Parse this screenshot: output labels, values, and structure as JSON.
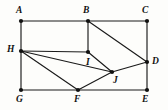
{
  "figure": {
    "background_color": "#fdfdfb",
    "line_color": "#1a1a1a",
    "vertex_color": "#111111",
    "width": 168,
    "height": 110,
    "vertices": [
      {
        "id": "A",
        "label": "A",
        "x": 21,
        "y": 21,
        "label_x": 16,
        "label_y": 6,
        "role": "top-left-corner"
      },
      {
        "id": "B",
        "label": "B",
        "x": 88,
        "y": 21,
        "label_x": 83,
        "label_y": 6,
        "role": "top-middle-corner"
      },
      {
        "id": "C",
        "label": "C",
        "x": 147,
        "y": 21,
        "label_x": 142,
        "label_y": 6,
        "role": "top-right-corner"
      },
      {
        "id": "D",
        "label": "D",
        "x": 147,
        "y": 62,
        "label_x": 152,
        "label_y": 57,
        "role": "right-interior-point"
      },
      {
        "id": "E",
        "label": "E",
        "x": 147,
        "y": 90,
        "label_x": 142,
        "label_y": 95,
        "role": "bottom-right-corner"
      },
      {
        "id": "F",
        "label": "F",
        "x": 78,
        "y": 90,
        "label_x": 74,
        "label_y": 95,
        "role": "bottom-middle-point"
      },
      {
        "id": "G",
        "label": "G",
        "x": 21,
        "y": 90,
        "label_x": 16,
        "label_y": 95,
        "role": "bottom-left-corner"
      },
      {
        "id": "H",
        "label": "H",
        "x": 21,
        "y": 51,
        "label_x": 7,
        "label_y": 45,
        "role": "left-interior-point"
      },
      {
        "id": "I",
        "label": "I",
        "x": 88,
        "y": 52,
        "label_x": 86,
        "label_y": 58,
        "role": "center-point"
      },
      {
        "id": "J",
        "label": "J",
        "x": 112,
        "y": 72,
        "label_x": 113,
        "label_y": 76,
        "role": "center-lower-point"
      }
    ],
    "edges": [
      {
        "id": "AB",
        "from": "A",
        "to": "B"
      },
      {
        "id": "BC",
        "from": "B",
        "to": "C"
      },
      {
        "id": "AH",
        "from": "A",
        "to": "H"
      },
      {
        "id": "HG",
        "from": "H",
        "to": "G"
      },
      {
        "id": "CD",
        "from": "C",
        "to": "D"
      },
      {
        "id": "DE",
        "from": "D",
        "to": "E"
      },
      {
        "id": "GF",
        "from": "G",
        "to": "F"
      },
      {
        "id": "FE",
        "from": "F",
        "to": "E"
      },
      {
        "id": "HI",
        "from": "H",
        "to": "I"
      },
      {
        "id": "BI",
        "from": "B",
        "to": "I"
      },
      {
        "id": "BD",
        "from": "B",
        "to": "D"
      },
      {
        "id": "HJ",
        "from": "H",
        "to": "J"
      },
      {
        "id": "HF",
        "from": "H",
        "to": "F"
      },
      {
        "id": "IJ",
        "from": "I",
        "to": "J"
      },
      {
        "id": "JF",
        "from": "J",
        "to": "F"
      },
      {
        "id": "JD",
        "from": "J",
        "to": "D"
      }
    ]
  }
}
